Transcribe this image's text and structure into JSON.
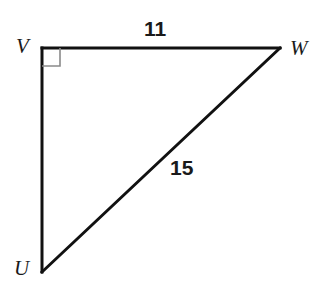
{
  "figure": {
    "canvas": {
      "width": 335,
      "height": 285,
      "background": "#ffffff"
    },
    "stroke_color": "#111111",
    "stroke_width": 3,
    "right_angle_color": "#8a8a8a",
    "right_angle_width": 1.6,
    "right_angle_size": 18,
    "vertices": [
      {
        "id": "V",
        "label": "V",
        "x": 42,
        "y": 48,
        "right_angle": true
      },
      {
        "id": "W",
        "label": "W",
        "x": 280,
        "y": 48,
        "right_angle": false
      },
      {
        "id": "U",
        "label": "U",
        "x": 42,
        "y": 272,
        "right_angle": false
      }
    ],
    "sides": [
      {
        "id": "VW",
        "from": "V",
        "to": "W",
        "label": "11",
        "kind": "leg"
      },
      {
        "id": "UW",
        "from": "U",
        "to": "W",
        "label": "15",
        "kind": "hypotenuse"
      },
      {
        "id": "VU",
        "from": "V",
        "to": "U",
        "label": "",
        "kind": "leg"
      }
    ]
  }
}
